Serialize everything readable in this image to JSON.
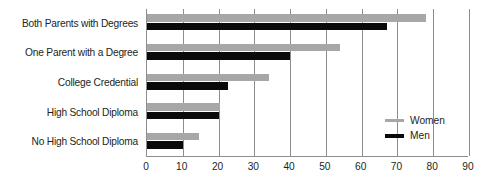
{
  "chart_data": {
    "type": "bar",
    "orientation": "horizontal",
    "title": "",
    "subtitle": "",
    "xlabel": "",
    "ylabel": "",
    "categories": [
      "Both Parents with Degrees",
      "One Parent with a Degree",
      "College Credential",
      "High School Diploma",
      "No High School Diploma"
    ],
    "series": [
      {
        "name": "Women",
        "color": "#a7a7a7",
        "values": [
          78,
          54,
          34,
          20.5,
          14.5
        ]
      },
      {
        "name": "Men",
        "color": "#0a0a0a",
        "values": [
          67,
          40,
          22.5,
          20,
          10
        ]
      }
    ],
    "xlim": [
      0,
      90
    ],
    "xticks": [
      0,
      10,
      20,
      30,
      40,
      50,
      60,
      70,
      80,
      90
    ],
    "xtick_labels": [
      "0",
      "10",
      "20",
      "30",
      "40",
      "50",
      "60",
      "70",
      "80",
      "90"
    ],
    "grid": "vertical",
    "legend_position": "inside-right-lower",
    "legend": [
      {
        "label": "Women",
        "color": "#a7a7a7"
      },
      {
        "label": "Men",
        "color": "#0a0a0a"
      }
    ]
  }
}
